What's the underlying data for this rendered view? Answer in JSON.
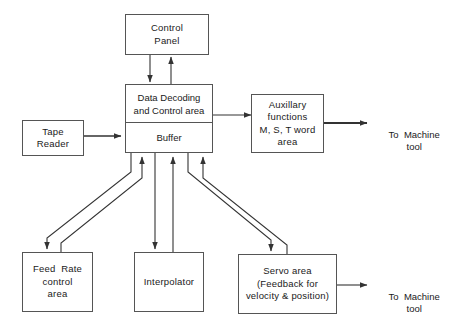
{
  "diagram": {
    "colors": {
      "background": "#ffffff",
      "box_border": "#555555",
      "connector": "#333333",
      "text": "#1a1a1a"
    },
    "nodes": {
      "control_panel": {
        "line1": "Control",
        "line2": "Panel"
      },
      "data_decoding": {
        "line1": "Data  Decoding",
        "line2": "and Control area"
      },
      "buffer": {
        "line1": "Buffer"
      },
      "tape_reader": {
        "line1": "Tape",
        "line2": "Reader"
      },
      "auxiliary": {
        "line1": "Auxillary",
        "line2": "functions",
        "line3": "M, S, T word",
        "line4": "area"
      },
      "feed_rate": {
        "line1": "Feed  Rate",
        "line2": "control",
        "line3": "area"
      },
      "interpolator": {
        "line1": "Interpolator"
      },
      "servo": {
        "line1": "Servo area",
        "line2": "(Feedback for",
        "line3": "velocity & position)"
      }
    },
    "labels": {
      "to_machine_tool_top": {
        "line1": "To  Machine",
        "line2": "tool"
      },
      "to_machine_tool_bottom": {
        "line1": "To  Machine",
        "line2": "tool"
      }
    },
    "connections": [
      {
        "from": "data_decoding",
        "to": "control_panel",
        "direction": "up"
      },
      {
        "from": "control_panel",
        "to": "data_decoding",
        "direction": "down"
      },
      {
        "from": "tape_reader",
        "to": "buffer",
        "direction": "right"
      },
      {
        "from": "data_decoding",
        "to": "auxiliary",
        "direction": "right"
      },
      {
        "from": "auxiliary",
        "to": "to_machine_tool_top",
        "direction": "right"
      },
      {
        "from": "buffer",
        "to": "feed_rate",
        "direction": "down-left"
      },
      {
        "from": "feed_rate",
        "to": "buffer",
        "direction": "up-right"
      },
      {
        "from": "buffer",
        "to": "interpolator",
        "direction": "down"
      },
      {
        "from": "interpolator",
        "to": "buffer",
        "direction": "up"
      },
      {
        "from": "buffer",
        "to": "servo",
        "direction": "down-right"
      },
      {
        "from": "servo",
        "to": "buffer",
        "direction": "up-left"
      },
      {
        "from": "servo",
        "to": "to_machine_tool_bottom",
        "direction": "right"
      }
    ]
  }
}
